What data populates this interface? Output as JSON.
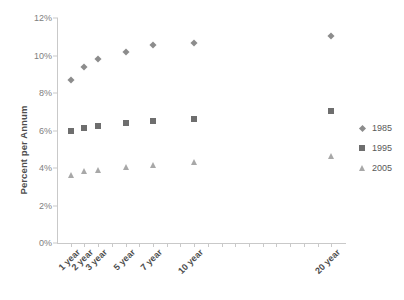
{
  "chart_data": {
    "type": "scatter",
    "title": "",
    "xlabel": "",
    "ylabel": "Percent per Annum",
    "categories": [
      "1 year",
      "2 year",
      "3 year",
      "5 year",
      "7 year",
      "10 year",
      "20 year"
    ],
    "x": [
      1,
      2,
      3,
      5,
      7,
      10,
      20
    ],
    "xlim": [
      0,
      21
    ],
    "ylim": [
      0,
      12
    ],
    "yticks": [
      "0%",
      "2%",
      "4%",
      "6%",
      "8%",
      "10%",
      "12%"
    ],
    "ytick_values": [
      0,
      2,
      4,
      6,
      8,
      10,
      12
    ],
    "ytick_format": "percent",
    "grid": false,
    "legend_position": "right",
    "series": [
      {
        "name": "1985",
        "marker": "diamond",
        "color": "#8c8c8c",
        "values": [
          8.7,
          9.4,
          9.8,
          10.2,
          10.55,
          10.65,
          11.05
        ]
      },
      {
        "name": "1995",
        "marker": "square",
        "color": "#6e6e6e",
        "values": [
          5.95,
          6.15,
          6.25,
          6.4,
          6.5,
          6.6,
          7.05
        ]
      },
      {
        "name": "2005",
        "marker": "triangle",
        "color": "#a8a8a8",
        "values": [
          3.65,
          3.85,
          3.9,
          4.05,
          4.15,
          4.3,
          4.65
        ]
      }
    ]
  },
  "legend": {
    "items": [
      {
        "label": "1985",
        "marker": "diamond"
      },
      {
        "label": "1995",
        "marker": "square"
      },
      {
        "label": "2005",
        "marker": "triangle"
      }
    ]
  }
}
